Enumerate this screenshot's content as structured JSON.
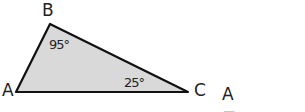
{
  "diagram": {
    "type": "triangle",
    "fill_color": "#d9d9d9",
    "stroke_color": "#111111",
    "vertices": [
      {
        "name": "A",
        "label": "A"
      },
      {
        "name": "B",
        "label": "B"
      },
      {
        "name": "C",
        "label": "C"
      }
    ],
    "angles": {
      "B": "95°",
      "C": "25°"
    },
    "question": {
      "prefix": "A =",
      "answer": ""
    }
  }
}
